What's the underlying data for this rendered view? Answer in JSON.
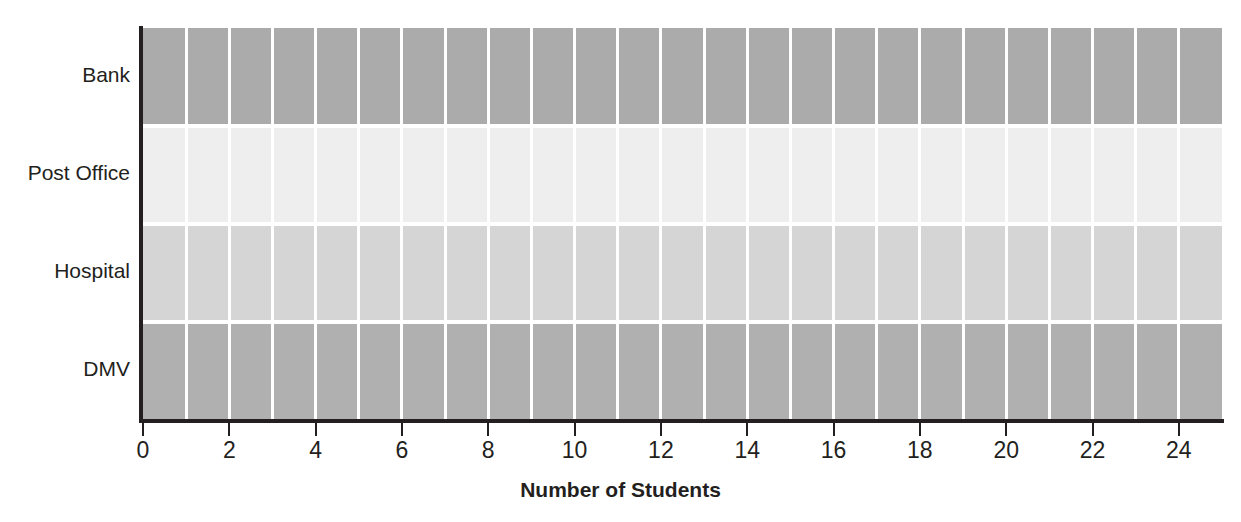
{
  "chart_data": {
    "type": "bar",
    "orientation": "horizontal",
    "title": "Bar graph of survey results of students by building location report",
    "xlabel": "Number of Students",
    "ylabel": "",
    "categories": [
      "Bank",
      "Post Office",
      "Hospital",
      "DMV"
    ],
    "values": [
      25,
      25,
      25,
      25
    ],
    "xlim": [
      0,
      25
    ],
    "xticks": [
      0,
      2,
      4,
      6,
      8,
      10,
      12,
      14,
      16,
      18,
      20,
      22,
      24
    ],
    "xtick_labels": [
      "0",
      "2",
      "4",
      "6",
      "8",
      "10",
      "12",
      "14",
      "16",
      "18",
      "20",
      "22",
      "24"
    ],
    "grid": "vertical-white-unit-gridlines",
    "legend": "none",
    "bar_colors": [
      "#ababab",
      "#eeeeee",
      "#d5d5d5",
      "#b0b0b0"
    ],
    "series": [
      {
        "name": "Number of Students",
        "values": [
          25,
          25,
          25,
          25
        ]
      }
    ]
  },
  "axis": {
    "line_color": "#231f20",
    "gridline_color": "#ffffff"
  },
  "background": "#ffffff"
}
